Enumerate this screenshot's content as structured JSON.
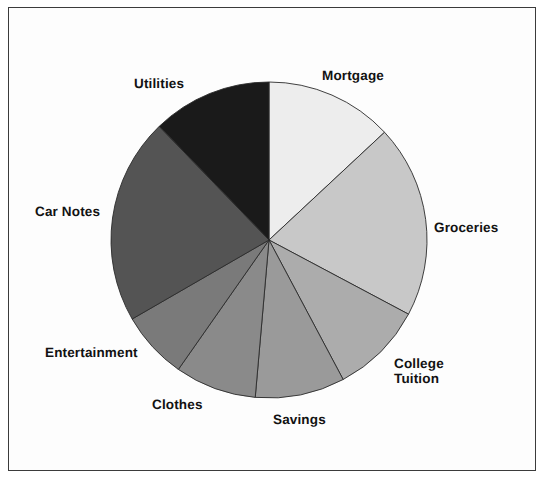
{
  "figure": {
    "kind": "pie-chart-figure",
    "border_color": "#3b3b3b",
    "background": "#fdfdfd"
  },
  "chart_data": {
    "type": "pie",
    "title": "",
    "subtitle": "",
    "xlabel": "",
    "ylabel": "",
    "grid": false,
    "legend_position": "none",
    "label_placement": "outside-around-pie",
    "start_angle_deg": 0,
    "direction": "clockwise",
    "center": {
      "x": 269,
      "y": 240
    },
    "radius": 158,
    "categories": [
      "Mortgage",
      "Groceries",
      "College Tuition",
      "Savings",
      "Clothes",
      "Entertainment",
      "Car Notes",
      "Utilities"
    ],
    "values": [
      13.0,
      19.7,
      9.4,
      9.2,
      8.3,
      6.9,
      21.1,
      12.4
    ],
    "value_unit": "percent",
    "slices": [
      {
        "label": "Mortgage",
        "value": 13.0,
        "start_deg": 0,
        "end_deg": 47,
        "sweep_deg": 47,
        "color": "#ededed"
      },
      {
        "label": "Groceries",
        "value": 19.7,
        "start_deg": 47,
        "end_deg": 118,
        "sweep_deg": 71,
        "color": "#c8c8c8"
      },
      {
        "label": "College Tuition",
        "value": 9.4,
        "start_deg": 118,
        "end_deg": 152,
        "sweep_deg": 34,
        "color": "#acacac"
      },
      {
        "label": "Savings",
        "value": 9.2,
        "start_deg": 152,
        "end_deg": 185,
        "sweep_deg": 33,
        "color": "#9a9a9a"
      },
      {
        "label": "Clothes",
        "value": 8.3,
        "start_deg": 185,
        "end_deg": 215,
        "sweep_deg": 30,
        "color": "#8a8a8a"
      },
      {
        "label": "Entertainment",
        "value": 6.9,
        "start_deg": 215,
        "end_deg": 240,
        "sweep_deg": 25,
        "color": "#7a7a7a"
      },
      {
        "label": "Car Notes",
        "value": 21.1,
        "start_deg": 240,
        "end_deg": 316,
        "sweep_deg": 76,
        "color": "#545454"
      },
      {
        "label": "Utilities",
        "value": 12.4,
        "start_deg": 316,
        "end_deg": 360,
        "sweep_deg": 44,
        "color": "#1a1a1a"
      }
    ],
    "slice_outline_color": "#2b2b2b"
  },
  "labels": {
    "mortgage": "Mortgage",
    "groceries": "Groceries",
    "college_tuition_line1": "College",
    "college_tuition_line2": "Tuition",
    "savings": "Savings",
    "clothes": "Clothes",
    "entertainment": "Entertainment",
    "car_notes": "Car Notes",
    "utilities": "Utilities"
  }
}
